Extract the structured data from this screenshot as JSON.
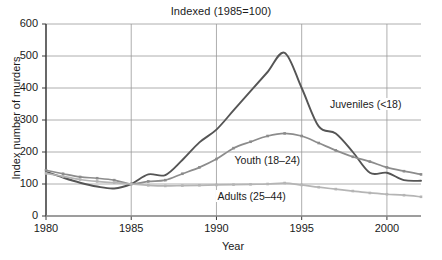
{
  "chart_data": {
    "type": "line",
    "title": "Indexed (1985=100)",
    "xlabel": "Year",
    "ylabel": "Index number of murders",
    "xlim": [
      1980,
      2002
    ],
    "ylim": [
      0,
      600
    ],
    "yticks": [
      0,
      100,
      200,
      300,
      400,
      500,
      600
    ],
    "xticks": [
      1980,
      1985,
      1990,
      1995,
      2000
    ],
    "grid": true,
    "legend": "inline-annotations",
    "x": [
      1980,
      1981,
      1982,
      1983,
      1984,
      1985,
      1986,
      1987,
      1988,
      1989,
      1990,
      1991,
      1992,
      1993,
      1994,
      1995,
      1996,
      1997,
      1998,
      1999,
      2000,
      2001,
      2002
    ],
    "series": [
      {
        "name": "Juveniles (<18)",
        "color": "#555555",
        "values": [
          138,
          120,
          104,
          92,
          86,
          100,
          130,
          128,
          175,
          230,
          270,
          330,
          390,
          450,
          510,
          400,
          280,
          258,
          200,
          135,
          135,
          112,
          110
        ]
      },
      {
        "name": "Youth (18–24)",
        "color": "#8c8c8c",
        "values": [
          143,
          132,
          122,
          118,
          112,
          100,
          108,
          112,
          132,
          152,
          178,
          212,
          232,
          250,
          258,
          250,
          228,
          205,
          185,
          170,
          152,
          140,
          130
        ]
      },
      {
        "name": "Adults (25–44)",
        "color": "#b5b5b5",
        "values": [
          133,
          124,
          114,
          108,
          104,
          100,
          96,
          94,
          95,
          96,
          97,
          98,
          99,
          100,
          103,
          97,
          90,
          84,
          78,
          72,
          68,
          65,
          60
        ]
      }
    ],
    "annotations": [
      {
        "text": "Juveniles (<18)",
        "x": 1996.6,
        "y": 350
      },
      {
        "text": "Youth (18–24)",
        "x": 1991.0,
        "y": 175
      },
      {
        "text": "Adults (25–44)",
        "x": 1990.0,
        "y": 62
      }
    ]
  }
}
